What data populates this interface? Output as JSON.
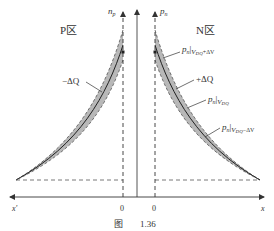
{
  "figure": {
    "caption_prefix": "图",
    "caption_number": "1.36",
    "regions": {
      "p_region": "P区",
      "n_region": "N区"
    },
    "axes": {
      "left_vertical": "n",
      "left_vertical_sub": "p",
      "right_vertical": "p",
      "right_vertical_sub": "n",
      "x_left": "x'",
      "x_right": "x",
      "origin_left": "0",
      "origin_right": "0"
    },
    "annotations": {
      "minus_dq": "−ΔQ",
      "plus_dq": "+ΔQ",
      "curve_upper_main": "p",
      "curve_upper_sub": "n",
      "curve_upper_cond": "V",
      "curve_upper_cond_sub": "DQ",
      "curve_upper_suffix": "+ΔV",
      "curve_mid_main": "p",
      "curve_mid_sub": "n",
      "curve_mid_cond": "V",
      "curve_mid_cond_sub": "DQ",
      "curve_lower_main": "p",
      "curve_lower_sub": "n",
      "curve_lower_cond": "V",
      "curve_lower_cond_sub": "DQ",
      "curve_lower_suffix": "−ΔV"
    },
    "colors": {
      "line": "#333333",
      "shade": "#b8b8b8",
      "dashed": "#555555"
    }
  }
}
